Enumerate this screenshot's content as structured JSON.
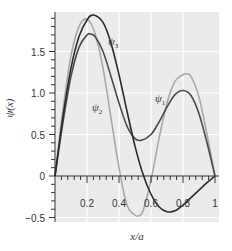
{
  "chart_data": {
    "type": "line",
    "title": "",
    "xlabel": "x/a",
    "ylabel": "ψ(x)",
    "xlim": [
      0,
      1
    ],
    "ylim": [
      -0.55,
      1.98
    ],
    "grid": true,
    "legend": "inline curve labels",
    "x_ticks": [
      0.2,
      0.4,
      0.6,
      0.8,
      1
    ],
    "x_tick_labels": [
      "0.2",
      "0.4",
      "0.6",
      "0.8",
      "1"
    ],
    "y_ticks": [
      -0.5,
      0,
      0.5,
      1.0,
      1.5
    ],
    "y_tick_labels": [
      "−0.5",
      "0",
      "0.5",
      "1.0",
      "1.5"
    ],
    "colors": {
      "background": "#ebebeb",
      "grid": "#ffffff",
      "psi1": "#2b2b2b",
      "psi2": "#a8a8a8",
      "psi3": "#4a4a4a"
    },
    "series": [
      {
        "name": "ψ1",
        "label": "ψ",
        "sub": "1",
        "color": "#2b2b2b",
        "x": [
          0,
          0.05,
          0.1,
          0.15,
          0.2,
          0.24,
          0.3,
          0.35,
          0.4,
          0.45,
          0.5,
          0.55,
          0.6,
          0.65,
          0.7,
          0.75,
          0.8,
          0.85,
          0.9,
          0.95,
          1.0
        ],
        "values": [
          0,
          0.72,
          1.3,
          1.68,
          1.88,
          1.94,
          1.85,
          1.6,
          1.22,
          0.78,
          0.36,
          0.02,
          -0.22,
          -0.37,
          -0.43,
          -0.42,
          -0.35,
          -0.26,
          -0.17,
          -0.08,
          0
        ]
      },
      {
        "name": "ψ2",
        "label": "ψ",
        "sub": "2",
        "color": "#a8a8a8",
        "x": [
          0,
          0.05,
          0.1,
          0.15,
          0.2,
          0.25,
          0.3,
          0.35,
          0.4,
          0.45,
          0.5,
          0.52,
          0.55,
          0.6,
          0.65,
          0.7,
          0.75,
          0.8,
          0.82,
          0.85,
          0.9,
          0.95,
          1.0
        ],
        "values": [
          0,
          0.8,
          1.45,
          1.8,
          1.89,
          1.72,
          1.3,
          0.7,
          0.1,
          -0.35,
          -0.47,
          -0.48,
          -0.42,
          -0.05,
          0.45,
          0.88,
          1.14,
          1.22,
          1.23,
          1.2,
          0.95,
          0.5,
          0
        ]
      },
      {
        "name": "ψ3",
        "label": "ψ",
        "sub": "3",
        "color": "#4a4a4a",
        "x": [
          0,
          0.05,
          0.1,
          0.15,
          0.2,
          0.22,
          0.25,
          0.3,
          0.35,
          0.4,
          0.45,
          0.5,
          0.54,
          0.6,
          0.65,
          0.7,
          0.75,
          0.8,
          0.85,
          0.9,
          0.95,
          1.0
        ],
        "values": [
          0,
          0.65,
          1.2,
          1.55,
          1.7,
          1.71,
          1.68,
          1.5,
          1.2,
          0.88,
          0.6,
          0.45,
          0.43,
          0.5,
          0.65,
          0.83,
          0.98,
          1.03,
          0.97,
          0.75,
          0.4,
          0
        ]
      }
    ],
    "annotations": [
      {
        "text": "ψ3",
        "x": 0.36,
        "y": 1.6
      },
      {
        "text": "ψ2",
        "x": 0.26,
        "y": 0.82
      },
      {
        "text": "ψ1",
        "x": 0.65,
        "y": 0.92
      }
    ]
  }
}
